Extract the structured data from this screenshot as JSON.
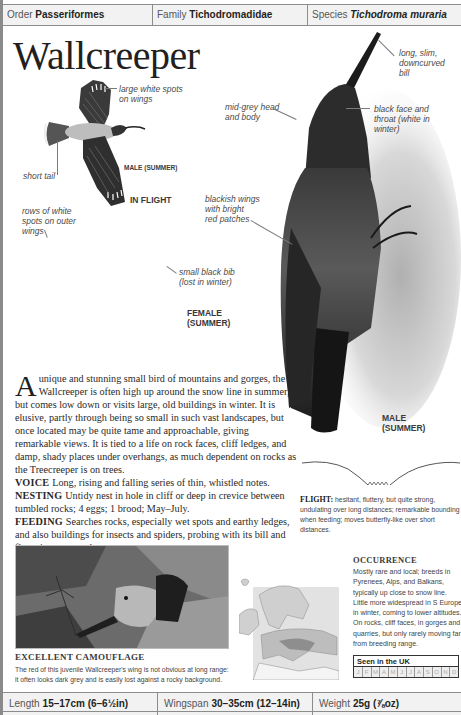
{
  "header": {
    "order_label": "Order",
    "order_value": "Passeriformes",
    "family_label": "Family",
    "family_value": "Tichodromadidae",
    "species_label": "Species",
    "species_value": "Tichodroma muraria"
  },
  "title": "Wallcreeper",
  "annotations": {
    "large_white_spots_1": "large white spots",
    "large_white_spots_2": "on wings",
    "short_tail": "short tail",
    "male_summer_flight": "MALE (SUMMER)",
    "in_flight": "IN FLIGHT",
    "rows_white_1": "rows of white",
    "rows_white_2": "spots on outer",
    "rows_white_3": "wings",
    "small_bib_1": "small black bib",
    "small_bib_2": "(lost in winter)",
    "female_1": "FEMALE",
    "female_2": "(SUMMER)",
    "bill_1": "long, slim,",
    "bill_2": "downcurved",
    "bill_3": "bill",
    "head_1": "mid-grey head",
    "head_2": "and body",
    "face_1": "black face and",
    "face_2": "throat (white in",
    "face_3": "winter)",
    "wings_1": "blackish wings",
    "wings_2": "with bright",
    "wings_3": "red patches",
    "male_1": "MALE",
    "male_2": "(SUMMER)"
  },
  "description": {
    "dropcap": "A",
    "intro": "unique and stunning small bird of mountains and gorges, the Wallcreeper is often high up around the snow line in summer, but comes low down or visits large, old buildings in winter. It is elusive, partly through being so small in such vast landscapes, but once located may be quite tame and approachable, giving remarkable views. It is tied to a life on rock faces, cliff ledges, and damp, shady places under overhangs, as much dependent on rocks as the Treecreeper is on trees.",
    "voice_label": "VOICE",
    "voice_text": "Long, rising and falling series of thin, whistled notes.",
    "nesting_label": "NESTING",
    "nesting_text": "Untidy nest in hole in cliff or deep in crevice between tumbled rocks; 4 eggs; 1 brood; May–July.",
    "feeding_label": "FEEDING",
    "feeding_text": "Searches rocks, especially wet spots and earthy ledges, and also buildings for insects and spiders, probing with its bill and fluttering constantly."
  },
  "flight": {
    "label": "FLIGHT:",
    "text": "hesitant, fluttery, but quite strong, undulating over long distances; remarkable bounding when feeding; moves butterfly-like over short distances."
  },
  "camouflage": {
    "title": "EXCELLENT CAMOUFLAGE",
    "text": "The red of this juvenile Wallcreeper's wing is not obvious at long range: it often looks dark grey and is easily lost against a rocky background."
  },
  "occurrence": {
    "title": "OCCURRENCE",
    "text": "Mostly rare and local; breeds in Pyrenees, Alps, and Balkans, typically up close to snow line. Little more widespread in S Europe in winter, coming to lower altitudes. On rocks, cliff faces, in gorges and quarries, but only rarely moving far from breeding range."
  },
  "seen_in_uk": {
    "title": "Seen in the UK",
    "months": [
      "J",
      "F",
      "M",
      "A",
      "M",
      "J",
      "J",
      "A",
      "S",
      "O",
      "N",
      "D"
    ]
  },
  "stats": {
    "length_label": "Length",
    "length_value": "15–17cm (6–6½in)",
    "wingspan_label": "Wingspan",
    "wingspan_value": "30–35cm (12–14in)",
    "weight_label": "Weight",
    "weight_value": "25g (⅞oz)"
  },
  "colors": {
    "rule_grey": "#8c8c8c",
    "bar_bg": "#f3f2f2",
    "text_dark": "#231f20",
    "caption_grey": "#4a4a4a"
  }
}
